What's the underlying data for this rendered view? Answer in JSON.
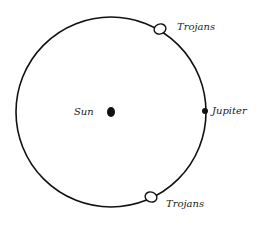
{
  "diagram": {
    "orbit": {
      "cx": 111,
      "cy": 112,
      "r": 95,
      "stroke": "#111111"
    },
    "bodies": {
      "sun": {
        "label": "Sun",
        "x": 111,
        "y": 112
      },
      "jupiter": {
        "label": "Jupiter",
        "x": 205,
        "y": 111
      },
      "trojans_leading": {
        "label": "Trojans",
        "x": 160,
        "y": 29
      },
      "trojans_trailing": {
        "label": "Trojans",
        "x": 151,
        "y": 197
      }
    }
  }
}
